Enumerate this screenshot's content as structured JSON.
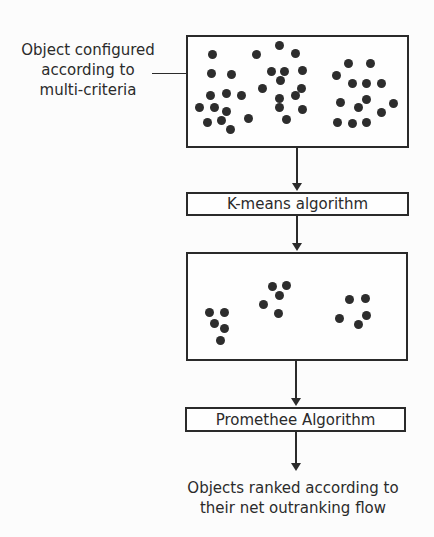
{
  "annotation": {
    "line1": "Object configured",
    "line2": "according to",
    "line3": "multi-criteria"
  },
  "process": {
    "kmeans_label": "K-means algorithm",
    "promethee_label": "Promethee Algorithm"
  },
  "output": {
    "line1": "Objects ranked according to",
    "line2": "their net outranking flow"
  },
  "colors": {
    "ink": "#2b2b2b",
    "dot": "#2d2d2d",
    "background": "#fcfcfc",
    "box_background": "#fefefe"
  },
  "objects_box": {
    "dots": [
      [
        26,
        19
      ],
      [
        25,
        38
      ],
      [
        45,
        39
      ],
      [
        24,
        60
      ],
      [
        40,
        58
      ],
      [
        55,
        60
      ],
      [
        13,
        72
      ],
      [
        28,
        72
      ],
      [
        40,
        76
      ],
      [
        21,
        87
      ],
      [
        35,
        85
      ],
      [
        44,
        94
      ],
      [
        62,
        83
      ],
      [
        93,
        10
      ],
      [
        70,
        19
      ],
      [
        109,
        18
      ],
      [
        85,
        36
      ],
      [
        98,
        36
      ],
      [
        116,
        35
      ],
      [
        94,
        45
      ],
      [
        76,
        53
      ],
      [
        115,
        53
      ],
      [
        109,
        60
      ],
      [
        93,
        63
      ],
      [
        93,
        72
      ],
      [
        116,
        74
      ],
      [
        100,
        84
      ],
      [
        162,
        28
      ],
      [
        184,
        28
      ],
      [
        150,
        40
      ],
      [
        166,
        48
      ],
      [
        180,
        48
      ],
      [
        195,
        48
      ],
      [
        154,
        67
      ],
      [
        180,
        64
      ],
      [
        172,
        72
      ],
      [
        207,
        68
      ],
      [
        195,
        77
      ],
      [
        151,
        87
      ],
      [
        166,
        88
      ],
      [
        180,
        87
      ]
    ]
  },
  "clusters_box": {
    "dots": [
      [
        23,
        60
      ],
      [
        38,
        60
      ],
      [
        28,
        71
      ],
      [
        38,
        76
      ],
      [
        34,
        88
      ],
      [
        86,
        34
      ],
      [
        100,
        33
      ],
      [
        93,
        43
      ],
      [
        77,
        52
      ],
      [
        92,
        61
      ],
      [
        163,
        47
      ],
      [
        179,
        46
      ],
      [
        180,
        63
      ],
      [
        153,
        66
      ],
      [
        172,
        72
      ]
    ]
  }
}
